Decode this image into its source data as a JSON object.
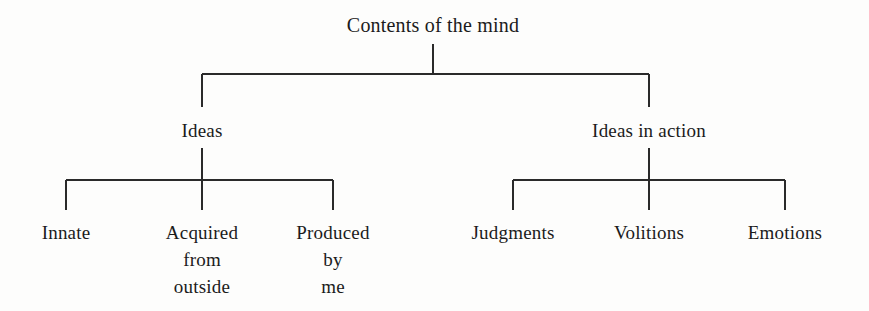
{
  "diagram": {
    "kind": "hierarchy-tree",
    "background_color": "#fdfdfc",
    "line_color": "#2a2a2a",
    "text_color": "#1b1b1b",
    "root": {
      "label": "Contents of the mind",
      "center_x": 433
    },
    "branches": [
      {
        "label": "Ideas",
        "center_x": 202,
        "children": [
          {
            "label": "Innate",
            "center_x": 66
          },
          {
            "label": "Acquired\nfrom\noutside",
            "center_x": 202
          },
          {
            "label": "Produced\nby\nme",
            "center_x": 333
          }
        ]
      },
      {
        "label": "Ideas in action",
        "center_x": 649,
        "children": [
          {
            "label": "Judgments",
            "center_x": 513
          },
          {
            "label": "Volitions",
            "center_x": 649
          },
          {
            "label": "Emotions",
            "center_x": 785
          }
        ]
      }
    ]
  }
}
